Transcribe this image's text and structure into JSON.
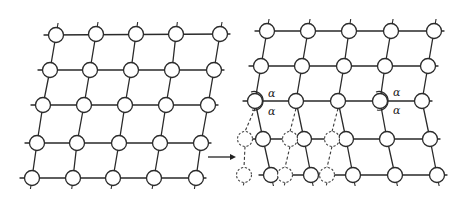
{
  "figure": {
    "left_panel": {
      "name": "original-lattice",
      "rows": 5,
      "cols": 5
    },
    "right_panel": {
      "name": "sheared-lattice",
      "rows": 5,
      "cols": 5,
      "vacancy_columns": 3,
      "vacancy_rows": 2
    },
    "arrow": {
      "direction": "right"
    },
    "angle_labels": [
      {
        "text": "α",
        "position": "upper",
        "node": "left"
      },
      {
        "text": "α",
        "position": "lower",
        "node": "left"
      },
      {
        "text": "α",
        "position": "upper",
        "node": "right"
      },
      {
        "text": "α",
        "position": "lower",
        "node": "right"
      }
    ],
    "colors": {
      "line": "#2a2a2a",
      "node_fill": "#ffffff",
      "background": "#ffffff"
    }
  }
}
